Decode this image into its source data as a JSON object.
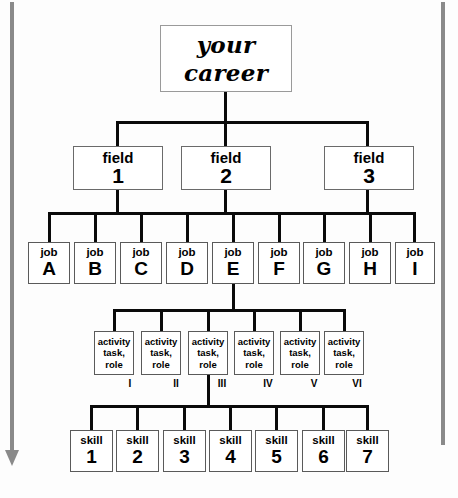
{
  "diagram": {
    "title_box": {
      "line1": "your",
      "line2": "career"
    },
    "guides": {
      "left_arrow_name": "progression-arrow-down",
      "right_line_name": "right-guide-line",
      "color": "#8a8a8a"
    },
    "levels": {
      "field": {
        "label": "field",
        "items": [
          {
            "label": "field",
            "num": "1"
          },
          {
            "label": "field",
            "num": "2"
          },
          {
            "label": "field",
            "num": "3"
          }
        ]
      },
      "job": {
        "label": "job",
        "items": [
          {
            "label": "job",
            "num": "A"
          },
          {
            "label": "job",
            "num": "B"
          },
          {
            "label": "job",
            "num": "C"
          },
          {
            "label": "job",
            "num": "D"
          },
          {
            "label": "job",
            "num": "E"
          },
          {
            "label": "job",
            "num": "F"
          },
          {
            "label": "job",
            "num": "G"
          },
          {
            "label": "job",
            "num": "H"
          },
          {
            "label": "job",
            "num": "I"
          }
        ]
      },
      "activity": {
        "line1": "activity",
        "line2": "task,",
        "line3": "role",
        "items": [
          {
            "line1": "activity",
            "line2": "task,",
            "line3": "role",
            "numeral": "I"
          },
          {
            "line1": "activity",
            "line2": "task,",
            "line3": "role",
            "numeral": "II"
          },
          {
            "line1": "activity",
            "line2": "task,",
            "line3": "role",
            "numeral": "III"
          },
          {
            "line1": "activity",
            "line2": "task,",
            "line3": "role",
            "numeral": "IV"
          },
          {
            "line1": "activity",
            "line2": "task,",
            "line3": "role",
            "numeral": "V"
          },
          {
            "line1": "activity",
            "line2": "task,",
            "line3": "role",
            "numeral": "VI"
          }
        ]
      },
      "skill": {
        "label": "skill",
        "items": [
          {
            "label": "skill",
            "num": "1"
          },
          {
            "label": "skill",
            "num": "2"
          },
          {
            "label": "skill",
            "num": "3"
          },
          {
            "label": "skill",
            "num": "4"
          },
          {
            "label": "skill",
            "num": "5"
          },
          {
            "label": "skill",
            "num": "6"
          },
          {
            "label": "skill",
            "num": "7"
          }
        ]
      }
    },
    "colors": {
      "line": "#0a0a0a",
      "box_border": "#5a5a5a",
      "guide": "#8a8a8a",
      "background": "#fdfdfd"
    }
  }
}
